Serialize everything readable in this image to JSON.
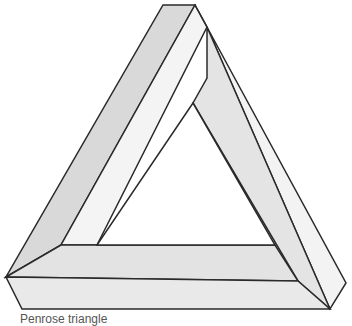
{
  "figure": {
    "subject": "Penrose triangle",
    "caption": "Penrose triangle",
    "colors": {
      "stroke": "#2a2a2a",
      "face_dark": "#d9d9d9",
      "face_mid": "#e6e6e6",
      "face_light": "#f3f3f3",
      "background": "#ffffff"
    }
  }
}
